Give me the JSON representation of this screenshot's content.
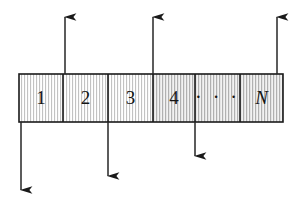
{
  "figure": {
    "kind": "array-tape-diagram",
    "background_color": "#ffffff",
    "ink_color": "#1a1a1a",
    "tape": {
      "x": 19,
      "y": 74,
      "width": 264,
      "height": 48,
      "border_color": "#1a1a1a",
      "border_width": 1.4,
      "hatch": "vertical-stripes",
      "hatch_color": "#b9b9b9"
    },
    "cells": [
      {
        "label": "1",
        "x": 19,
        "width": 44,
        "style": "plain",
        "fill": "#fbfbfb"
      },
      {
        "label": "2",
        "x": 63,
        "width": 45,
        "style": "plain",
        "fill": "#f7f7f7"
      },
      {
        "label": "3",
        "x": 108,
        "width": 45,
        "style": "plain",
        "fill": "#f4f4f4"
      },
      {
        "label": "4",
        "x": 153,
        "width": 42,
        "style": "plain",
        "fill": "#eeeeee"
      },
      {
        "label": "· · ·",
        "x": 195,
        "width": 45,
        "style": "ellipsis",
        "fill": "#ececec"
      },
      {
        "label": "N",
        "x": 240,
        "width": 43,
        "style": "italic",
        "fill": "#eaeaea"
      }
    ],
    "arrows_up": [
      {
        "name": "arrow-up-1",
        "x": 65,
        "tip_y": 17,
        "tail_y": 74
      },
      {
        "name": "arrow-up-2",
        "x": 153,
        "tip_y": 17,
        "tail_y": 74
      },
      {
        "name": "arrow-up-3",
        "x": 277,
        "tip_y": 17,
        "tail_y": 74
      }
    ],
    "arrows_down": [
      {
        "name": "arrow-down-1",
        "x": 21,
        "tail_y": 122,
        "tip_y": 190
      },
      {
        "name": "arrow-down-2",
        "x": 108,
        "tail_y": 122,
        "tip_y": 176
      },
      {
        "name": "arrow-down-3",
        "x": 195,
        "tail_y": 122,
        "tip_y": 156
      }
    ]
  }
}
